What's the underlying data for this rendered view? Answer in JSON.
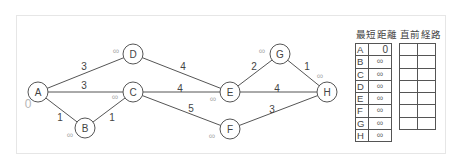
{
  "graph": {
    "nodes": [
      {
        "id": "A",
        "label": "A",
        "x": 38,
        "y": 92,
        "dist_label": "0",
        "dist_x": 28,
        "dist_y": 108
      },
      {
        "id": "B",
        "label": "B",
        "x": 85,
        "y": 128,
        "dist_label": "∞",
        "dist_x": 70,
        "dist_y": 138
      },
      {
        "id": "C",
        "label": "C",
        "x": 133,
        "y": 92,
        "dist_label": "∞",
        "dist_x": 115,
        "dist_y": 100
      },
      {
        "id": "D",
        "label": "D",
        "x": 133,
        "y": 54,
        "dist_label": "∞",
        "dist_x": 116,
        "dist_y": 54
      },
      {
        "id": "E",
        "label": "E",
        "x": 230,
        "y": 92,
        "dist_label": "∞",
        "dist_x": 213,
        "dist_y": 102
      },
      {
        "id": "F",
        "label": "F",
        "x": 230,
        "y": 129,
        "dist_label": "∞",
        "dist_x": 212,
        "dist_y": 139
      },
      {
        "id": "G",
        "label": "G",
        "x": 280,
        "y": 54,
        "dist_label": "∞",
        "dist_x": 262,
        "dist_y": 54
      },
      {
        "id": "H",
        "label": "H",
        "x": 327,
        "y": 92,
        "dist_label": "∞",
        "dist_x": 320,
        "dist_y": 79
      }
    ],
    "edges": [
      {
        "from": "A",
        "to": "D",
        "weight": "3",
        "lx": 84,
        "ly": 70
      },
      {
        "from": "A",
        "to": "C",
        "weight": "3",
        "lx": 84,
        "ly": 89
      },
      {
        "from": "A",
        "to": "B",
        "weight": "1",
        "lx": 60,
        "ly": 121
      },
      {
        "from": "B",
        "to": "C",
        "weight": "1",
        "lx": 112,
        "ly": 121
      },
      {
        "from": "D",
        "to": "E",
        "weight": "4",
        "lx": 183,
        "ly": 70
      },
      {
        "from": "C",
        "to": "E",
        "weight": "4",
        "lx": 180,
        "ly": 92
      },
      {
        "from": "C",
        "to": "F",
        "weight": "5",
        "lx": 191,
        "ly": 112
      },
      {
        "from": "E",
        "to": "G",
        "weight": "2",
        "lx": 254,
        "ly": 70
      },
      {
        "from": "E",
        "to": "H",
        "weight": "4",
        "lx": 277,
        "ly": 92
      },
      {
        "from": "G",
        "to": "H",
        "weight": "1",
        "lx": 307,
        "ly": 70
      },
      {
        "from": "F",
        "to": "H",
        "weight": "3",
        "lx": 272,
        "ly": 113
      }
    ]
  },
  "tables": {
    "shortest_distance": {
      "title": "最短距離",
      "rows": [
        {
          "node": "A",
          "value": "0"
        },
        {
          "node": "B",
          "value": "∞"
        },
        {
          "node": "C",
          "value": "∞"
        },
        {
          "node": "D",
          "value": "∞"
        },
        {
          "node": "E",
          "value": "∞"
        },
        {
          "node": "F",
          "value": "∞"
        },
        {
          "node": "G",
          "value": "∞"
        },
        {
          "node": "H",
          "value": "∞"
        }
      ]
    },
    "previous_path": {
      "title": "直前経路",
      "rows": [
        [
          "",
          ""
        ],
        [
          "",
          ""
        ],
        [
          "",
          ""
        ],
        [
          "",
          ""
        ],
        [
          "",
          ""
        ],
        [
          "",
          ""
        ],
        [
          "",
          ""
        ]
      ]
    }
  }
}
